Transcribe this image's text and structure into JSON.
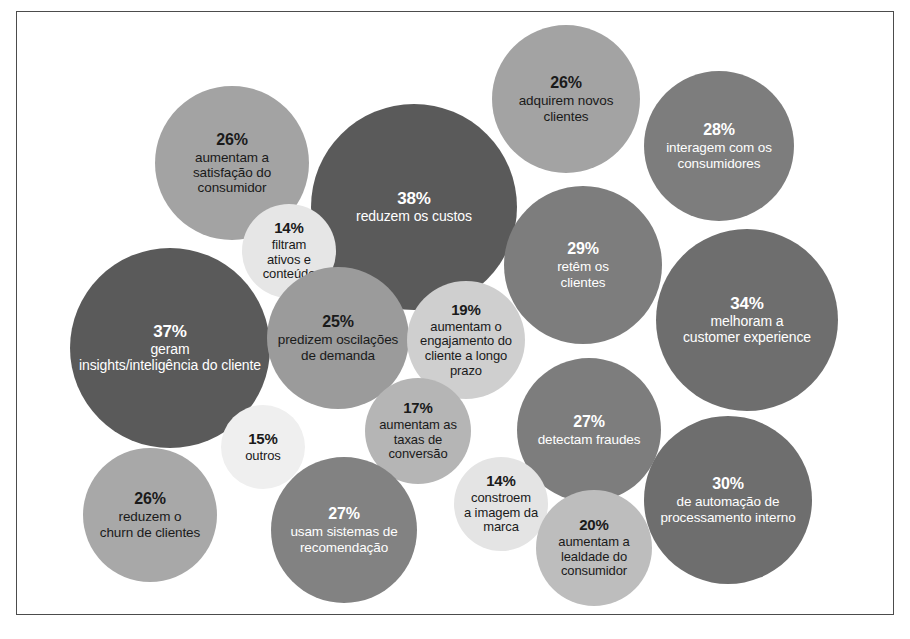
{
  "figure": {
    "type": "bubble-chart",
    "background": "#ffffff",
    "frame_color": "#4c4c4c",
    "width": 910,
    "height": 639,
    "unit": "%"
  },
  "chart_data": {
    "type": "bubble",
    "title": "",
    "subtitle": "",
    "xlabel": "",
    "ylabel": "",
    "grid": false,
    "legend": "none",
    "value_unit": "%",
    "language": "pt-BR",
    "categories": [
      "aumentam a satisfação do consumidor",
      "adquirem novos clientes",
      "interagem com os consumidores",
      "reduzem os custos",
      "filtram ativos e conteúdo",
      "retêm os clientes",
      "geram insights/inteligência do cliente",
      "melhoram a customer experience",
      "predizem oscilações de demanda",
      "aumentam o engajamento do cliente a longo prazo",
      "detectam fraudes",
      "outros",
      "aumentam as taxas de conversão",
      "constroem a imagem da marca",
      "de automação de processamento interno",
      "reduzem o churn de clientes",
      "usam sistemas de recomendação",
      "aumentam a lealdade do consumidor"
    ],
    "values": [
      26,
      26,
      28,
      38,
      14,
      29,
      37,
      34,
      25,
      19,
      27,
      15,
      17,
      14,
      30,
      26,
      27,
      20
    ],
    "bubbles": [
      {
        "id": "satisfacao-consumidor",
        "percent": "26%",
        "value": 26,
        "label": "aumentam a\nsatisfação do\nconsumidor",
        "label_lines": [
          "aumentam a",
          "satisfação do",
          "consumidor"
        ],
        "cx": 232,
        "cy": 163,
        "r": 77,
        "fill": "#a3a3a3",
        "text_color": "#1a1a1a",
        "pct_size": 16,
        "label_size": 13.5
      },
      {
        "id": "adquirem-novos-clientes",
        "percent": "26%",
        "value": 26,
        "label": "adquirem novos\nclientes",
        "label_lines": [
          "adquirem novos",
          "clientes"
        ],
        "cx": 566,
        "cy": 99,
        "r": 74,
        "fill": "#a3a3a3",
        "text_color": "#1a1a1a",
        "pct_size": 16,
        "label_size": 13.5
      },
      {
        "id": "interagem-consumidores",
        "percent": "28%",
        "value": 28,
        "label": "interagem com os\nconsumidores",
        "label_lines": [
          "interagem com os",
          "consumidores"
        ],
        "cx": 719,
        "cy": 146,
        "r": 75,
        "fill": "#7d7d7d",
        "text_color": "#ffffff",
        "pct_size": 16,
        "label_size": 13.5
      },
      {
        "id": "reduzem-custos",
        "percent": "38%",
        "value": 38,
        "label": "reduzem os custos",
        "label_lines": [
          "reduzem os custos"
        ],
        "cx": 414,
        "cy": 207,
        "r": 103,
        "fill": "#5a5a5a",
        "text_color": "#ffffff",
        "pct_size": 17,
        "label_size": 14
      },
      {
        "id": "filtram-ativos-conteudo",
        "percent": "14%",
        "value": 14,
        "label": "filtram\nativos e\nconteúdo",
        "label_lines": [
          "filtram",
          "ativos e",
          "conteúdo"
        ],
        "cx": 289,
        "cy": 251,
        "r": 47,
        "fill": "#e6e6e6",
        "text_color": "#1a1a1a",
        "pct_size": 15,
        "label_size": 13
      },
      {
        "id": "retem-clientes",
        "percent": "29%",
        "value": 29,
        "label": "retêm os\nclientes",
        "label_lines": [
          "retêm os",
          "clientes"
        ],
        "cx": 583,
        "cy": 265,
        "r": 79,
        "fill": "#7d7d7d",
        "text_color": "#ffffff",
        "pct_size": 16,
        "label_size": 13.5
      },
      {
        "id": "geram-insights",
        "percent": "37%",
        "value": 37,
        "label": "geram\ninsights/inteligência do cliente",
        "label_lines": [
          "geram",
          "insights/inteligência do cliente"
        ],
        "cx": 170,
        "cy": 348,
        "r": 100,
        "fill": "#5a5a5a",
        "text_color": "#ffffff",
        "pct_size": 17,
        "label_size": 14
      },
      {
        "id": "melhoram-customer-experience",
        "percent": "34%",
        "value": 34,
        "label": "melhoram a\ncustomer experience",
        "label_lines": [
          "melhoram a",
          "customer experience"
        ],
        "cx": 747,
        "cy": 320,
        "r": 91,
        "fill": "#6e6e6e",
        "text_color": "#ffffff",
        "pct_size": 17,
        "label_size": 14
      },
      {
        "id": "predizem-oscilacoes-demanda",
        "percent": "25%",
        "value": 25,
        "label": "predizem oscilações\nde demanda",
        "label_lines": [
          "predizem oscilações",
          "de demanda"
        ],
        "cx": 338,
        "cy": 338,
        "r": 71,
        "fill": "#9b9b9b",
        "text_color": "#1a1a1a",
        "pct_size": 16,
        "label_size": 13.5
      },
      {
        "id": "engajamento-longo-prazo",
        "percent": "19%",
        "value": 19,
        "label": "aumentam o\nengajamento do\ncliente a longo\nprazo",
        "label_lines": [
          "aumentam o",
          "engajamento do",
          "cliente a longo",
          "prazo"
        ],
        "cx": 466,
        "cy": 340,
        "r": 59,
        "fill": "#cfcfcf",
        "text_color": "#1a1a1a",
        "pct_size": 15,
        "label_size": 13
      },
      {
        "id": "detectam-fraudes",
        "percent": "27%",
        "value": 27,
        "label": "detectam fraudes",
        "label_lines": [
          "detectam fraudes"
        ],
        "cx": 589,
        "cy": 430,
        "r": 72,
        "fill": "#7d7d7d",
        "text_color": "#ffffff",
        "pct_size": 16,
        "label_size": 13.5
      },
      {
        "id": "outros",
        "percent": "15%",
        "value": 15,
        "label": "outros",
        "label_lines": [
          "outros"
        ],
        "cx": 263,
        "cy": 447,
        "r": 42,
        "fill": "#efefef",
        "text_color": "#1a1a1a",
        "pct_size": 15,
        "label_size": 13
      },
      {
        "id": "taxas-conversao",
        "percent": "17%",
        "value": 17,
        "label": "aumentam as\ntaxas de\nconversão",
        "label_lines": [
          "aumentam as",
          "taxas de",
          "conversão"
        ],
        "cx": 418,
        "cy": 431,
        "r": 53,
        "fill": "#b5b5b5",
        "text_color": "#1a1a1a",
        "pct_size": 15,
        "label_size": 13
      },
      {
        "id": "imagem-da-marca",
        "percent": "14%",
        "value": 14,
        "label": "constroem\na imagem da\nmarca",
        "label_lines": [
          "constroem",
          "a imagem da",
          "marca"
        ],
        "cx": 501,
        "cy": 504,
        "r": 47,
        "fill": "#e4e4e4",
        "text_color": "#1a1a1a",
        "pct_size": 15,
        "label_size": 13
      },
      {
        "id": "automacao-processamento-interno",
        "percent": "30%",
        "value": 30,
        "label": "de automação de\nprocessamento interno",
        "label_lines": [
          "de automação de",
          "processamento interno"
        ],
        "cx": 728,
        "cy": 500,
        "r": 84,
        "fill": "#6e6e6e",
        "text_color": "#ffffff",
        "pct_size": 16,
        "label_size": 13.5
      },
      {
        "id": "churn-de-clientes",
        "percent": "26%",
        "value": 26,
        "label": "reduzem o\nchurn de clientes",
        "label_lines": [
          "reduzem o",
          "churn de clientes"
        ],
        "cx": 150,
        "cy": 515,
        "r": 67,
        "fill": "#a8a8a8",
        "text_color": "#1a1a1a",
        "pct_size": 16,
        "label_size": 13.5
      },
      {
        "id": "sistemas-de-recomendacao",
        "percent": "27%",
        "value": 27,
        "label": "usam sistemas de\nrecomendação",
        "label_lines": [
          "usam sistemas de",
          "recomendação"
        ],
        "cx": 344,
        "cy": 530,
        "r": 73,
        "fill": "#828282",
        "text_color": "#ffffff",
        "pct_size": 16,
        "label_size": 13.5
      },
      {
        "id": "lealdade-do-consumidor",
        "percent": "20%",
        "value": 20,
        "label": "aumentam a\nlealdade do\nconsumidor",
        "label_lines": [
          "aumentam a",
          "lealdade do",
          "consumidor"
        ],
        "cx": 594,
        "cy": 548,
        "r": 58,
        "fill": "#bdbdbd",
        "text_color": "#1a1a1a",
        "pct_size": 15,
        "label_size": 13
      }
    ]
  }
}
